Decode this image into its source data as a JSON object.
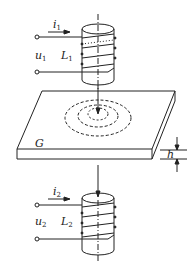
{
  "figure": {
    "type": "eddy-current sensor schematic",
    "colors": {
      "stroke": "#222222",
      "background": "#ffffff"
    },
    "top_coil": {
      "current_label": "i",
      "current_sub": "1",
      "voltage_label": "u",
      "voltage_sub": "1",
      "inductance_label": "L",
      "inductance_sub": "1"
    },
    "plate": {
      "label": "G",
      "thickness_label": "h"
    },
    "bottom_coil": {
      "current_label": "i",
      "current_sub": "2",
      "voltage_label": "u",
      "voltage_sub": "2",
      "inductance_label": "L",
      "inductance_sub": "2"
    }
  }
}
